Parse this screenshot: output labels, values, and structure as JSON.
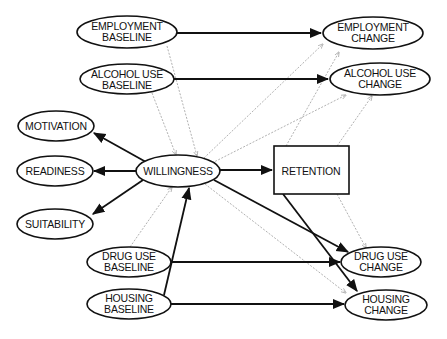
{
  "diagram": {
    "type": "path-model",
    "nodes": {
      "employment_baseline": {
        "lines": [
          "EMPLOYMENT",
          "BASELINE"
        ]
      },
      "alcohol_baseline": {
        "lines": [
          "ALCOHOL USE",
          "BASELINE"
        ]
      },
      "motivation": {
        "lines": [
          "MOTIVATION"
        ]
      },
      "readiness": {
        "lines": [
          "READINESS"
        ]
      },
      "suitability": {
        "lines": [
          "SUITABILITY"
        ]
      },
      "willingness": {
        "lines": [
          "WILLINGNESS"
        ]
      },
      "retention": {
        "lines": [
          "RETENTION"
        ]
      },
      "employment_change": {
        "lines": [
          "EMPLOYMENT",
          "CHANGE"
        ]
      },
      "alcohol_change": {
        "lines": [
          "ALCOHOL USE",
          "CHANGE"
        ]
      },
      "drug_baseline": {
        "lines": [
          "DRUG USE",
          "BASELINE"
        ]
      },
      "housing_baseline": {
        "lines": [
          "HOUSING",
          "BASELINE"
        ]
      },
      "drug_change": {
        "lines": [
          "DRUG USE",
          "CHANGE"
        ]
      },
      "housing_change": {
        "lines": [
          "HOUSING",
          "CHANGE"
        ]
      }
    },
    "solid_edges": [
      [
        "employment_baseline",
        "employment_change"
      ],
      [
        "alcohol_baseline",
        "alcohol_change"
      ],
      [
        "willingness",
        "motivation"
      ],
      [
        "willingness",
        "readiness"
      ],
      [
        "willingness",
        "suitability"
      ],
      [
        "willingness",
        "retention"
      ],
      [
        "willingness",
        "drug_change"
      ],
      [
        "retention",
        "housing_change"
      ],
      [
        "housing_baseline",
        "willingness"
      ],
      [
        "drug_baseline",
        "drug_change"
      ],
      [
        "housing_baseline",
        "housing_change"
      ]
    ],
    "dotted_edges": [
      [
        "employment_baseline",
        "willingness"
      ],
      [
        "alcohol_baseline",
        "willingness"
      ],
      [
        "willingness",
        "employment_change"
      ],
      [
        "willingness",
        "alcohol_change"
      ],
      [
        "retention",
        "employment_change"
      ],
      [
        "retention",
        "alcohol_change"
      ],
      [
        "drug_baseline",
        "willingness"
      ],
      [
        "willingness",
        "housing_change"
      ],
      [
        "retention",
        "drug_change"
      ]
    ]
  }
}
